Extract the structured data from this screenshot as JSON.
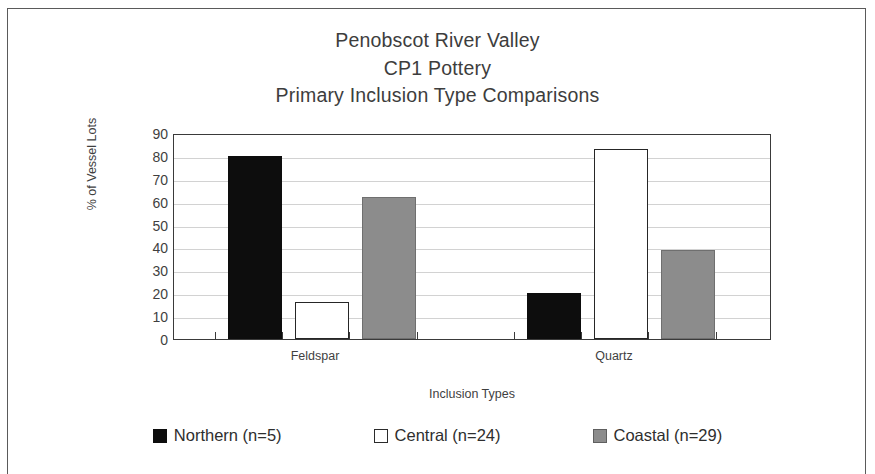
{
  "chart_data": {
    "type": "bar",
    "title": "Penobscot River Valley\nCP1 Pottery\nPrimary Inclusion Type Comparisons",
    "title_lines": [
      "Penobscot River Valley",
      "CP1 Pottery",
      "Primary Inclusion Type Comparisons"
    ],
    "categories": [
      "Feldspar",
      "Quartz"
    ],
    "series": [
      {
        "name": "Northern (n=5)",
        "values": [
          80,
          20
        ],
        "color": "#0d0d0d"
      },
      {
        "name": "Central (n=24)",
        "values": [
          16,
          83
        ],
        "color": "#ffffff"
      },
      {
        "name": "Coastal (n=29)",
        "values": [
          62,
          39
        ],
        "color": "#8c8c8c"
      }
    ],
    "xlabel": "Inclusion Types",
    "ylabel": "% of Vessel Lots",
    "ylim": [
      0,
      90
    ],
    "ytick_labels": [
      "90",
      "80",
      "70",
      "60",
      "50",
      "40",
      "30",
      "20",
      "10",
      "0"
    ],
    "ytick_values": [
      90,
      80,
      70,
      60,
      50,
      40,
      30,
      20,
      10,
      0
    ],
    "grid": true,
    "legend_position": "bottom"
  },
  "legend": {
    "items": [
      {
        "label": "Northern (n=5)"
      },
      {
        "label": "Central (n=24)"
      },
      {
        "label": "Coastal (n=29)"
      }
    ]
  },
  "colors": {
    "northern": "#0d0d0d",
    "central": "#ffffff",
    "coastal": "#8c8c8c",
    "axis": "#3a3a3a",
    "grid": "#d2d2d2",
    "text": "#3f3f3f"
  }
}
